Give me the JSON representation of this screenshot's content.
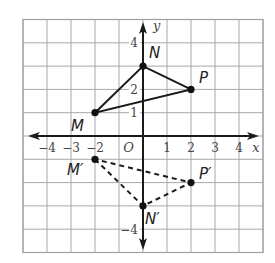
{
  "diagram": {
    "type": "coordinate-plane-reflection",
    "grid": {
      "x_min": -5,
      "x_max": 5,
      "y_min": -5,
      "y_max": 5,
      "origin_px": [
        143,
        136
      ],
      "unit_px_x": 24,
      "unit_px_y": 23.3
    },
    "axes": {
      "x_label": "x",
      "y_label": "y",
      "origin_label": "O",
      "x_ticks": [
        {
          "value": -4,
          "label": "−4"
        },
        {
          "value": -3,
          "label": "−3"
        },
        {
          "value": -2,
          "label": "−2"
        },
        {
          "value": 1,
          "label": "1"
        },
        {
          "value": 2,
          "label": "2"
        },
        {
          "value": 3,
          "label": "3"
        },
        {
          "value": 4,
          "label": "4"
        }
      ],
      "y_ticks": [
        {
          "value": 4,
          "label": "4"
        },
        {
          "value": 2,
          "label": "2"
        },
        {
          "value": 1,
          "label": "1"
        },
        {
          "value": -4,
          "label": "−4"
        }
      ]
    },
    "original_triangle": {
      "style": "solid",
      "vertices": [
        {
          "name": "M",
          "x": -2,
          "y": 1
        },
        {
          "name": "N",
          "x": 0,
          "y": 3
        },
        {
          "name": "P",
          "x": 2,
          "y": 2
        }
      ]
    },
    "image_triangle": {
      "style": "dashed",
      "vertices": [
        {
          "name": "M′",
          "x": -2,
          "y": -1
        },
        {
          "name": "N′",
          "x": 0,
          "y": -3
        },
        {
          "name": "P′",
          "x": 2,
          "y": -2
        }
      ]
    },
    "colors": {
      "grid": "#a8a8a8",
      "axis": "#1a1a1a",
      "edges": "#1a1a1a",
      "text": "#222222"
    }
  }
}
